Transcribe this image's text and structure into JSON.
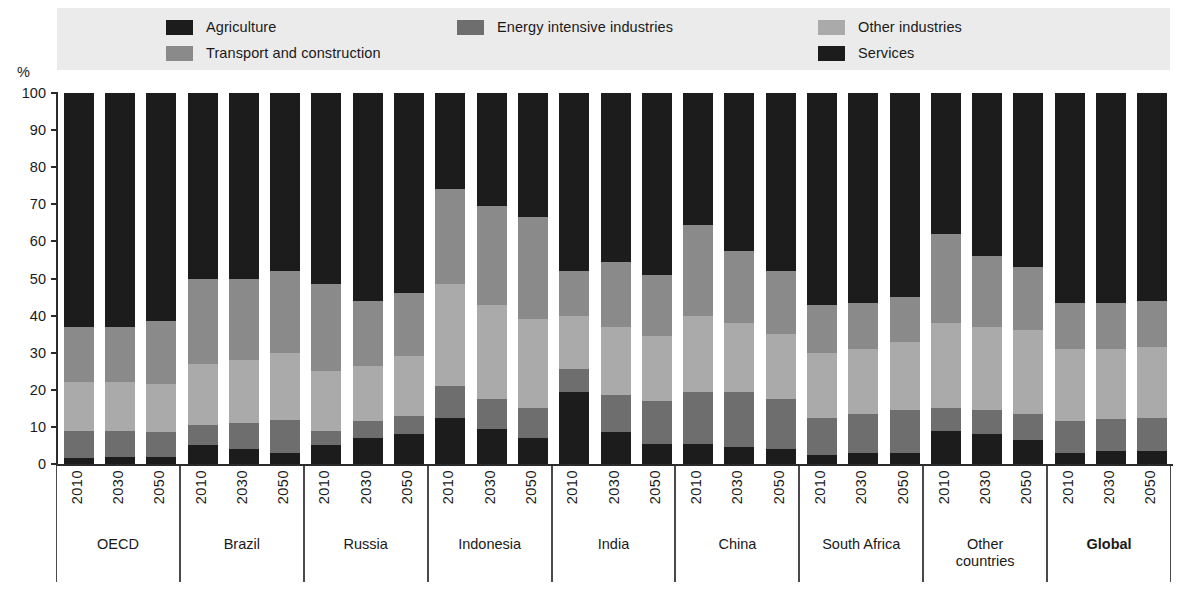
{
  "legend": {
    "rows": [
      [
        {
          "label": "Agriculture",
          "color": "#1c1c1c",
          "key": "agriculture"
        },
        {
          "label": "Energy intensive industries",
          "color": "#6e6e6e",
          "key": "energy"
        },
        {
          "label": "Other industries",
          "color": "#aaaaaa",
          "key": "other"
        }
      ],
      [
        {
          "label": "Transport and construction",
          "color": "#8a8a8a",
          "key": "transport"
        },
        {
          "label": "",
          "color": "",
          "key": "spacer"
        },
        {
          "label": "Services",
          "color": "#1c1c1c",
          "key": "services"
        }
      ]
    ],
    "background": "#ebebeb"
  },
  "axis": {
    "unit": "%",
    "y_ticks": [
      "100",
      "90",
      "80",
      "70",
      "60",
      "50",
      "40",
      "30",
      "20",
      "10",
      "0"
    ]
  },
  "chart_data": {
    "type": "bar",
    "subtype": "stacked-100-percent",
    "title": "",
    "xlabel": "",
    "ylabel": "%",
    "ylim": [
      0,
      100
    ],
    "ytick_step": 10,
    "grid": false,
    "legend_position": "top",
    "series": [
      {
        "name": "Agriculture",
        "color": "#1c1c1c"
      },
      {
        "name": "Energy intensive industries",
        "color": "#6e6e6e"
      },
      {
        "name": "Other industries",
        "color": "#aaaaaa"
      },
      {
        "name": "Transport and construction",
        "color": "#8a8a8a"
      },
      {
        "name": "Services",
        "color": "#1c1c1c"
      }
    ],
    "years": [
      "2010",
      "2030",
      "2050"
    ],
    "groups": [
      {
        "name": "OECD",
        "bold": false,
        "bars": [
          {
            "year": "2010",
            "values": {
              "agriculture": 1.5,
              "energy": 7.5,
              "other": 13.0,
              "transport": 15.0,
              "services": 63.0
            }
          },
          {
            "year": "2030",
            "values": {
              "agriculture": 2.0,
              "energy": 7.0,
              "other": 13.0,
              "transport": 15.0,
              "services": 63.0
            }
          },
          {
            "year": "2050",
            "values": {
              "agriculture": 2.0,
              "energy": 6.5,
              "other": 13.0,
              "transport": 17.0,
              "services": 61.5
            }
          }
        ]
      },
      {
        "name": "Brazil",
        "bold": false,
        "bars": [
          {
            "year": "2010",
            "values": {
              "agriculture": 5.0,
              "energy": 5.5,
              "other": 16.5,
              "transport": 23.0,
              "services": 50.0
            }
          },
          {
            "year": "2030",
            "values": {
              "agriculture": 4.0,
              "energy": 7.0,
              "other": 17.0,
              "transport": 22.0,
              "services": 50.0
            }
          },
          {
            "year": "2050",
            "values": {
              "agriculture": 3.0,
              "energy": 9.0,
              "other": 18.0,
              "transport": 22.0,
              "services": 48.0
            }
          }
        ]
      },
      {
        "name": "Russia",
        "bold": false,
        "bars": [
          {
            "year": "2010",
            "values": {
              "agriculture": 5.0,
              "energy": 4.0,
              "other": 16.0,
              "transport": 23.5,
              "services": 51.5
            }
          },
          {
            "year": "2030",
            "values": {
              "agriculture": 7.0,
              "energy": 4.5,
              "other": 15.0,
              "transport": 17.5,
              "services": 56.0
            }
          },
          {
            "year": "2050",
            "values": {
              "agriculture": 8.0,
              "energy": 5.0,
              "other": 16.0,
              "transport": 17.0,
              "services": 54.0
            }
          }
        ]
      },
      {
        "name": "Indonesia",
        "bold": false,
        "bars": [
          {
            "year": "2010",
            "values": {
              "agriculture": 12.5,
              "energy": 8.5,
              "other": 27.5,
              "transport": 25.5,
              "services": 26.0
            }
          },
          {
            "year": "2030",
            "values": {
              "agriculture": 9.5,
              "energy": 8.0,
              "other": 25.5,
              "transport": 26.5,
              "services": 30.5
            }
          },
          {
            "year": "2050",
            "values": {
              "agriculture": 7.0,
              "energy": 8.0,
              "other": 24.0,
              "transport": 27.5,
              "services": 33.5
            }
          }
        ]
      },
      {
        "name": "India",
        "bold": false,
        "bars": [
          {
            "year": "2010",
            "values": {
              "agriculture": 19.5,
              "energy": 6.0,
              "other": 14.5,
              "transport": 12.0,
              "services": 48.0
            }
          },
          {
            "year": "2030",
            "values": {
              "agriculture": 8.5,
              "energy": 10.0,
              "other": 18.5,
              "transport": 17.5,
              "services": 45.5
            }
          },
          {
            "year": "2050",
            "values": {
              "agriculture": 5.5,
              "energy": 11.5,
              "other": 17.5,
              "transport": 16.5,
              "services": 49.0
            }
          }
        ]
      },
      {
        "name": "China",
        "bold": false,
        "bars": [
          {
            "year": "2010",
            "values": {
              "agriculture": 5.5,
              "energy": 14.0,
              "other": 20.5,
              "transport": 24.5,
              "services": 35.5
            }
          },
          {
            "year": "2030",
            "values": {
              "agriculture": 4.5,
              "energy": 15.0,
              "other": 18.5,
              "transport": 19.5,
              "services": 42.5
            }
          },
          {
            "year": "2050",
            "values": {
              "agriculture": 4.0,
              "energy": 13.5,
              "other": 17.5,
              "transport": 17.0,
              "services": 48.0
            }
          }
        ]
      },
      {
        "name": "South Africa",
        "bold": false,
        "bars": [
          {
            "year": "2010",
            "values": {
              "agriculture": 2.5,
              "energy": 10.0,
              "other": 17.5,
              "transport": 13.0,
              "services": 57.0
            }
          },
          {
            "year": "2030",
            "values": {
              "agriculture": 3.0,
              "energy": 10.5,
              "other": 17.5,
              "transport": 12.5,
              "services": 56.5
            }
          },
          {
            "year": "2050",
            "values": {
              "agriculture": 3.0,
              "energy": 11.5,
              "other": 18.5,
              "transport": 12.0,
              "services": 55.0
            }
          }
        ]
      },
      {
        "name": "Other\ncountries",
        "bold": false,
        "bars": [
          {
            "year": "2010",
            "values": {
              "agriculture": 9.0,
              "energy": 6.0,
              "other": 23.0,
              "transport": 24.0,
              "services": 38.0
            }
          },
          {
            "year": "2030",
            "values": {
              "agriculture": 8.0,
              "energy": 6.5,
              "other": 22.5,
              "transport": 19.0,
              "services": 44.0
            }
          },
          {
            "year": "2050",
            "values": {
              "agriculture": 6.5,
              "energy": 7.0,
              "other": 22.5,
              "transport": 17.0,
              "services": 47.0
            }
          }
        ]
      },
      {
        "name": "Global",
        "bold": true,
        "bars": [
          {
            "year": "2010",
            "values": {
              "agriculture": 3.0,
              "energy": 8.5,
              "other": 19.5,
              "transport": 12.5,
              "services": 56.5
            }
          },
          {
            "year": "2030",
            "values": {
              "agriculture": 3.5,
              "energy": 8.5,
              "other": 19.0,
              "transport": 12.5,
              "services": 56.5
            }
          },
          {
            "year": "2050",
            "values": {
              "agriculture": 3.5,
              "energy": 9.0,
              "other": 19.0,
              "transport": 12.5,
              "services": 56.0
            }
          }
        ]
      }
    ]
  }
}
